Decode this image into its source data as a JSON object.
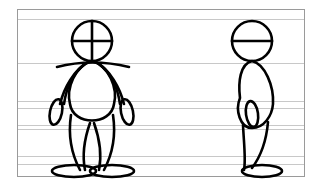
{
  "title": "Character turnaround sketch on lined paper",
  "colors": {
    "background": "#ffffff",
    "frame": "#9a9a9a",
    "guide_lines": "#c8c8c8",
    "ink": "#000000"
  },
  "guide_lines_y": [
    19,
    63,
    101,
    108,
    125,
    129,
    156,
    164
  ],
  "views": [
    {
      "label": "front view"
    },
    {
      "label": "side view"
    }
  ]
}
